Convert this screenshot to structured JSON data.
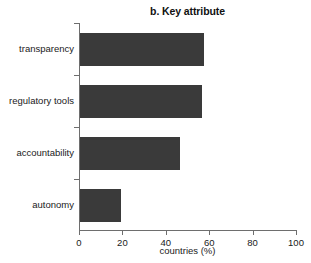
{
  "chart_data": {
    "type": "bar",
    "orientation": "horizontal",
    "title": "b. Key attribute",
    "xlabel": "countries (%)",
    "ylabel": "",
    "categories": [
      "transparency",
      "regulatory tools",
      "accountability",
      "autonomy"
    ],
    "values": [
      57,
      56,
      46,
      19
    ],
    "xlim": [
      0,
      100
    ],
    "xticks": [
      0,
      20,
      40,
      60,
      80,
      100
    ],
    "xtick_labels": [
      "0",
      "20",
      "40",
      "60",
      "80",
      "100"
    ],
    "grid": false,
    "legend": null,
    "series": [
      {
        "name": "countries (%)",
        "values": [
          57,
          56,
          46,
          19
        ]
      }
    ],
    "colors": {
      "bar_fill": "#3a3a3a",
      "axis": "#6e6e6e",
      "text": "#1a1a1a",
      "background": "#ffffff"
    }
  }
}
